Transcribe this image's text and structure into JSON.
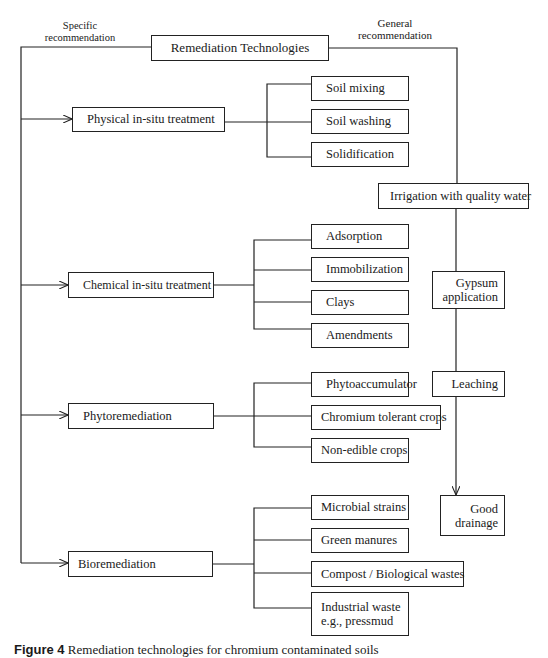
{
  "header": {
    "specific_label": "Specific recommendation",
    "general_label": "General recommendation",
    "root": "Remediation Technologies"
  },
  "specific": {
    "physical": {
      "label": "Physical in-situ treatment",
      "items": [
        "Soil mixing",
        "Soil washing",
        "Solidification"
      ]
    },
    "chemical": {
      "label": "Chemical in-situ treatment",
      "items": [
        "Adsorption",
        "Immobilization",
        "Clays",
        "Amendments"
      ]
    },
    "phyto": {
      "label": "Phytoremediation",
      "items": [
        "Phytoaccumulator",
        "Chromium tolerant crops",
        "Non-edible crops"
      ]
    },
    "bio": {
      "label": "Bioremediation",
      "items": [
        "Microbial strains",
        "Green manures",
        "Compost / Biological wastes",
        "Industrial waste",
        "e.g., pressmud"
      ]
    }
  },
  "general": {
    "irrigation": "Irrigation with quality water",
    "gypsum_1": "Gypsum",
    "gypsum_2": "application",
    "leaching": "Leaching",
    "drainage_1": "Good",
    "drainage_2": "drainage"
  },
  "caption": {
    "prefix": "Figure 4",
    "text": "Remediation technologies for chromium contaminated soils"
  }
}
